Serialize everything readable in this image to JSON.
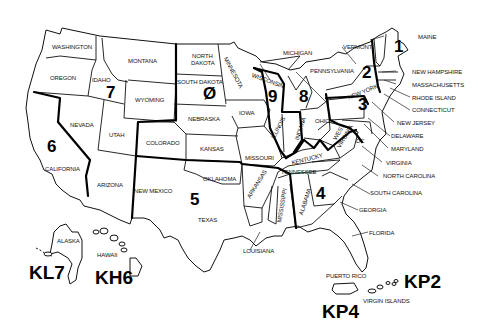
{
  "map": {
    "title": "US Amateur Radio Call Districts",
    "districts": [
      {
        "number": "1",
        "states": [
          "MAINE",
          "VERMONT",
          "NEW HAMPSHIRE",
          "MASSACHUSETTS",
          "RHODE ISLAND",
          "CONNECTICUT"
        ]
      },
      {
        "number": "2",
        "states": [
          "NEW YORK",
          "NEW JERSEY"
        ]
      },
      {
        "number": "3",
        "states": [
          "PENNSYLVANIA",
          "DELAWARE",
          "MARYLAND",
          "DC"
        ]
      },
      {
        "number": "4",
        "states": [
          "VIRGINIA",
          "NORTH CAROLINA",
          "SOUTH CAROLINA",
          "GEORGIA",
          "FLORIDA",
          "ALABAMA",
          "TENNESSEE",
          "KENTUCKY"
        ]
      },
      {
        "number": "5",
        "states": [
          "TEXAS",
          "OKLAHOMA",
          "ARKANSAS",
          "LOUISIANA",
          "MISSISSIPPI",
          "NEW MEXICO"
        ]
      },
      {
        "number": "6",
        "states": [
          "CALIFORNIA"
        ]
      },
      {
        "number": "7",
        "states": [
          "WASHINGTON",
          "OREGON",
          "IDAHO",
          "MONTANA",
          "WYOMING",
          "NEVADA",
          "UTAH",
          "ARIZONA"
        ]
      },
      {
        "number": "8",
        "states": [
          "MICHIGAN",
          "OHIO",
          "WEST VIRGINIA"
        ]
      },
      {
        "number": "9",
        "states": [
          "WISCONSIN",
          "ILLINOIS",
          "INDIANA"
        ]
      },
      {
        "number": "Ø",
        "states": [
          "NORTH DAKOTA",
          "SOUTH DAKOTA",
          "MINNESOTA",
          "IOWA",
          "NEBRASKA",
          "KANSAS",
          "MISSOURI",
          "COLORADO"
        ]
      }
    ],
    "labels": {
      "washington": "WASHINGTON",
      "oregon": "OREGON",
      "idaho": "IDAHO",
      "montana": "MONTANA",
      "wyoming": "WYOMING",
      "north_dakota_1": "NORTH",
      "north_dakota_2": "DAKOTA",
      "south_dakota": "SOUTH DAKOTA",
      "minnesota": "MINNESOTA",
      "nebraska": "NEBRASKA",
      "iowa": "IOWA",
      "nevada": "NEVADA",
      "utah": "UTAH",
      "colorado": "COLORADO",
      "kansas": "KANSAS",
      "missouri": "MISSOURI",
      "california": "CALIFORNIA",
      "arizona": "ARIZONA",
      "new_mexico": "NEW MEXICO",
      "oklahoma": "OKLAHOMA",
      "texas": "TEXAS",
      "arkansas": "ARKANSAS",
      "louisiana": "LOUISIANA",
      "mississippi": "MISSISSIPPI",
      "alabama": "ALABAMA",
      "tennessee": "TENNESSEE",
      "kentucky": "KENTUCKY",
      "illinois": "ILLINOIS",
      "indiana": "INDIANA",
      "ohio": "OHIO",
      "west_virginia_1": "WEST",
      "west_virginia_2": "VIRGINIA",
      "wisconsin": "WISCONSIN",
      "michigan": "MICHIGAN",
      "pennsylvania": "PENNSYLVANIA",
      "new_york": "NEW YORK",
      "vermont": "VERMONT",
      "maine": "MAINE",
      "new_hampshire": "NEW HAMPSHIRE",
      "massachusetts": "MASSACHUSETTS",
      "rhode_island": "RHODE ISLAND",
      "connecticut": "CONNECTICUT",
      "new_jersey": "NEW JERSEY",
      "delaware": "DELAWARE",
      "maryland": "MARYLAND",
      "dc": "DC",
      "virginia": "VIRGINIA",
      "north_carolina": "NORTH CAROLINA",
      "south_carolina": "SOUTH CAROLINA",
      "georgia": "GEORGIA",
      "florida": "FLORIDA",
      "alaska": "ALASKA",
      "hawaii": "HAWAII",
      "puerto_rico": "PUERTO RICO",
      "virgin_islands": "VIRGIN ISLANDS"
    },
    "district_numbers": {
      "d1": "1",
      "d2": "2",
      "d3": "3",
      "d4": "4",
      "d5": "5",
      "d6": "6",
      "d7": "7",
      "d8": "8",
      "d9": "9",
      "d0": "Ø"
    },
    "callsign_prefixes": {
      "alaska": "KL7",
      "hawaii": "KH6",
      "puerto_rico": "KP4",
      "virgin_islands": "KP2"
    }
  }
}
